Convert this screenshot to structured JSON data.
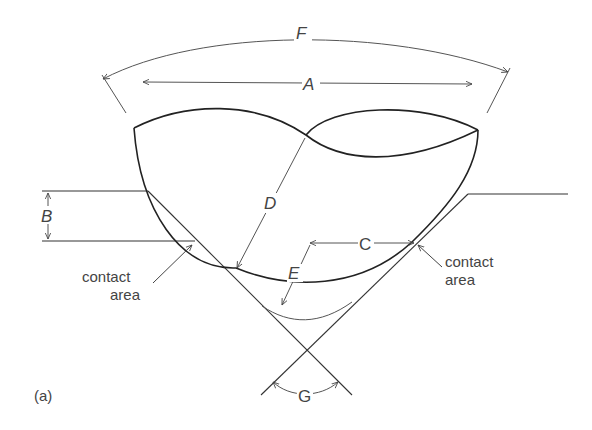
{
  "diagram": {
    "panel_label": "(a)",
    "labels": {
      "A": "A",
      "B": "B",
      "C": "C",
      "D": "D",
      "E": "E",
      "F": "F",
      "G": "G"
    },
    "annotations": {
      "left_contact_line1": "contact",
      "left_contact_line2": "area",
      "right_contact_line1": "contact",
      "right_contact_line2": "area"
    },
    "colors": {
      "stroke_dark": "#222222",
      "stroke_light": "#555555",
      "text": "#444444",
      "background": "#ffffff"
    }
  }
}
